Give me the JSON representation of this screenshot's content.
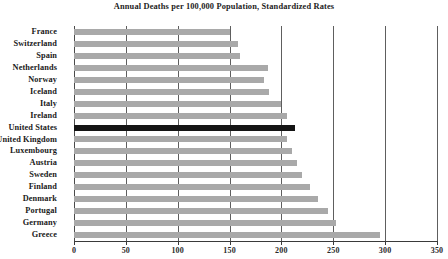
{
  "chart_data": {
    "type": "bar",
    "orientation": "horizontal",
    "title": "Annual Deaths per 100,000 Population, Standardized Rates",
    "supertitle": "",
    "xlabel": "",
    "ylabel": "",
    "xlim": [
      0,
      350
    ],
    "xticks": [
      0,
      50,
      100,
      150,
      200,
      250,
      300,
      350
    ],
    "xtick_labels": [
      "0",
      "50",
      "100",
      "150",
      "200",
      "250",
      "300",
      "350"
    ],
    "grid": true,
    "grid_axis": "x",
    "legend": false,
    "bar_color": "#a9a9a9",
    "highlight_color": "#141414",
    "highlight_category": "United States",
    "categories": [
      "France",
      "Switzerland",
      "Spain",
      "Netherlands",
      "Norway",
      "Iceland",
      "Italy",
      "Ireland",
      "United States",
      "United Kingdom",
      "Luxembourg",
      "Austria",
      "Sweden",
      "Finland",
      "Denmark",
      "Portugal",
      "Germany",
      "Greece"
    ],
    "values": [
      150,
      158,
      160,
      187,
      183,
      188,
      200,
      205,
      213,
      205,
      210,
      215,
      220,
      228,
      235,
      245,
      253,
      295
    ]
  }
}
